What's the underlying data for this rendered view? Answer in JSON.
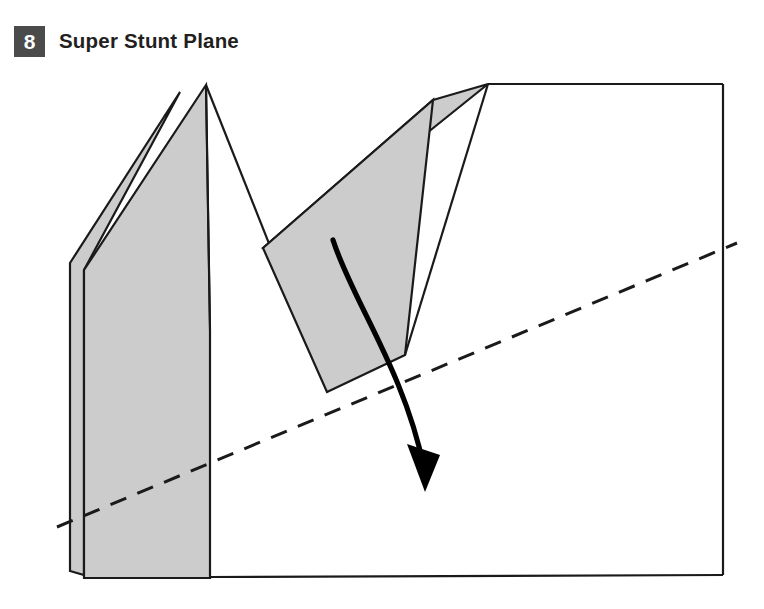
{
  "page": {
    "background": "#ffffff",
    "width": 764,
    "height": 609
  },
  "header": {
    "step_number": "8",
    "title": "Super Stunt Plane",
    "badge_color": "#4b4b4b",
    "badge_text_color": "#ffffff",
    "title_color": "#231f20"
  },
  "figure": {
    "name": "paper-airplane-fold-diagram",
    "colors": {
      "paper_shade": "#cccccc",
      "paper_white": "#ffffff",
      "outline": "#1a1a1a",
      "arrow": "#000000",
      "fold_line": "#1a1a1a"
    },
    "shapes": {
      "body_outline": "M 206,85 L 488,84 L 723,84 L 723,575 L 75,575 L 75,263 Z",
      "far_wing": "M 180,92 L 70,263 L 70,571 L 84,575 L 84,270 Z",
      "near_wing": "M 206,85 L 84,270 L 84,578 L 210,578 L 210,330 Z",
      "body_white_right": "M 206,85 L 210,330 L 210,578 L 723,575 L 723,84 L 488,84 Z",
      "flap_top_strip": "M 433,100 L 488,84 L 275,255 L 263,248 Z",
      "flap_main": "M 263,248 L 433,100 L 405,355 L 327,392 Z",
      "fold_edge": "M 488,84 L 405,355",
      "sheet_right_edge": "M 723,84 L 723,575",
      "sheet_bottom_edge": "M 75,575 L 723,575",
      "dashed_crease": "M 57,527 L 737,243",
      "curved_arrow_path": "M 333,240 C 352,300 404,370 424,468",
      "arrow_head_tip": [
        425,
        492
      ]
    },
    "dash_pattern": "17 12",
    "labels": {
      "step_badge": "8",
      "step_title": "Super Stunt Plane"
    }
  }
}
